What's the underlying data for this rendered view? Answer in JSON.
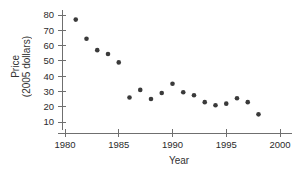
{
  "chart_data": {
    "type": "scatter",
    "title": "",
    "xlabel": "Year",
    "ylabel": "Price",
    "ylabel_line2": "(2005 dollars)",
    "ylabel_full": "Price (2005 dollars)",
    "xlim": [
      1979,
      2001
    ],
    "ylim": [
      5,
      84
    ],
    "grid": false,
    "legend": null,
    "xticks": [
      1980,
      1985,
      1990,
      1995,
      2000
    ],
    "xtick_labels": [
      "1980",
      "1985",
      "1990",
      "1995",
      "2000"
    ],
    "yticks": [
      10,
      20,
      30,
      40,
      50,
      60,
      70,
      80
    ],
    "ytick_labels": [
      "10",
      "20",
      "30",
      "40",
      "50",
      "60",
      "70",
      "80"
    ],
    "marker": "filled-circle",
    "marker_color": "#3a3a3a",
    "x": [
      1981,
      1982,
      1983,
      1984,
      1985,
      1986,
      1987,
      1988,
      1989,
      1990,
      1991,
      1992,
      1993,
      1994,
      1995,
      1996,
      1997,
      1998
    ],
    "values": [
      77,
      64.5,
      57,
      54.5,
      49,
      26,
      31,
      25,
      29,
      35,
      29.5,
      27.5,
      23,
      21,
      22,
      25.5,
      23,
      15
    ],
    "points": [
      {
        "year": 1981,
        "price": 77
      },
      {
        "year": 1982,
        "price": 64.5
      },
      {
        "year": 1983,
        "price": 57
      },
      {
        "year": 1984,
        "price": 54.5
      },
      {
        "year": 1985,
        "price": 49
      },
      {
        "year": 1986,
        "price": 26
      },
      {
        "year": 1987,
        "price": 31
      },
      {
        "year": 1988,
        "price": 25
      },
      {
        "year": 1989,
        "price": 29
      },
      {
        "year": 1990,
        "price": 35
      },
      {
        "year": 1991,
        "price": 29.5
      },
      {
        "year": 1992,
        "price": 27.5
      },
      {
        "year": 1993,
        "price": 23
      },
      {
        "year": 1994,
        "price": 21
      },
      {
        "year": 1995,
        "price": 22
      },
      {
        "year": 1996,
        "price": 25.5
      },
      {
        "year": 1997,
        "price": 23
      },
      {
        "year": 1998,
        "price": 15
      }
    ]
  }
}
